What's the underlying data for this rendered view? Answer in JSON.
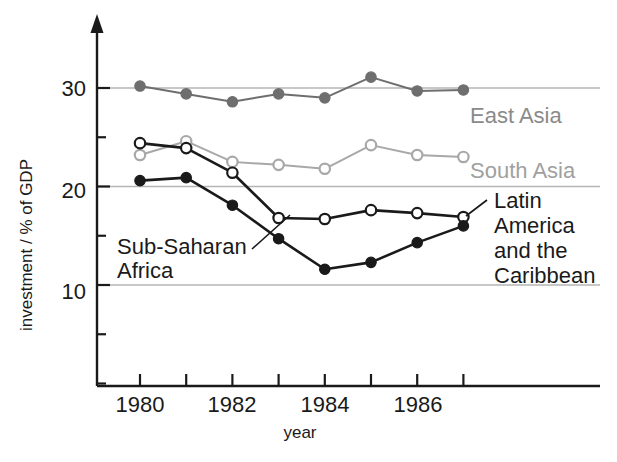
{
  "chart_data": {
    "type": "line",
    "title": "",
    "xlabel": "year",
    "ylabel": "investment / % of GDP",
    "x": [
      1980,
      1981,
      1982,
      1983,
      1984,
      1985,
      1986,
      1987
    ],
    "xlim": [
      1979.5,
      1987.5
    ],
    "ylim": [
      0,
      35
    ],
    "xticks": [
      1980,
      1981,
      1982,
      1983,
      1984,
      1985,
      1986,
      1987
    ],
    "xtick_labels": [
      "1980",
      "",
      "1982",
      "",
      "1984",
      "",
      "1986",
      ""
    ],
    "yticks": [
      5,
      10,
      15,
      20,
      25,
      30
    ],
    "ytick_labels": [
      "",
      "10",
      "",
      "20",
      "",
      "30"
    ],
    "gridlines_y": [
      10,
      20,
      30
    ],
    "grid": true,
    "legend_position": "inline-annotations",
    "series": [
      {
        "name": "East Asia",
        "color": "#6e6e6e",
        "marker": "filled-circle",
        "values": [
          30.2,
          29.4,
          28.6,
          29.4,
          29.0,
          31.1,
          29.7,
          29.8
        ]
      },
      {
        "name": "South Asia",
        "color": "#a8a8a8",
        "marker": "open-circle",
        "values": [
          23.2,
          24.6,
          22.5,
          22.2,
          21.8,
          24.2,
          23.2,
          23.0
        ]
      },
      {
        "name": "Latin America and the Caribbean",
        "color": "#1a1a1a",
        "marker": "open-circle",
        "values": [
          24.4,
          23.9,
          21.4,
          16.8,
          16.7,
          17.6,
          17.3,
          16.9
        ]
      },
      {
        "name": "Sub-Saharan Africa",
        "color": "#1a1a1a",
        "marker": "filled-circle",
        "values": [
          20.6,
          20.9,
          18.1,
          14.7,
          11.6,
          12.3,
          14.3,
          16.0
        ]
      }
    ],
    "annotations": [
      {
        "text": "East Asia",
        "series": "East Asia"
      },
      {
        "text": "South Asia",
        "series": "South Asia"
      },
      {
        "text": "Sub-Saharan",
        "series": "Sub-Saharan Africa"
      },
      {
        "text": "Africa",
        "series": "Sub-Saharan Africa"
      },
      {
        "text": "Latin",
        "series": "Latin America and the Caribbean"
      },
      {
        "text": "America",
        "series": "Latin America and the Caribbean"
      },
      {
        "text": "and the",
        "series": "Latin America and the Caribbean"
      },
      {
        "text": "Caribbean",
        "series": "Latin America and the Caribbean"
      }
    ]
  },
  "axes": {
    "y_title": "investment / % of GDP",
    "x_title": "year",
    "y_tick_30": "30",
    "y_tick_20": "20",
    "y_tick_10": "10",
    "x_tick_1980": "1980",
    "x_tick_1982": "1982",
    "x_tick_1984": "1984",
    "x_tick_1986": "1986"
  },
  "labels": {
    "east_asia": "East Asia",
    "south_asia": "South Asia",
    "sub_saharan_1": "Sub-Saharan",
    "sub_saharan_2": "Africa",
    "latin_1": "Latin",
    "latin_2": "America",
    "latin_3": "and the",
    "latin_4": "Caribbean"
  },
  "colors": {
    "east_asia": "#6e6e6e",
    "south_asia": "#a8a8a8",
    "latin_america": "#1a1a1a",
    "sub_saharan": "#1a1a1a",
    "axis": "#1a1a1a",
    "grid": "#b5b5b5"
  }
}
